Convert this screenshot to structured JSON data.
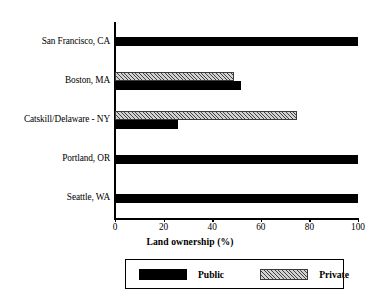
{
  "chart_data": {
    "type": "bar",
    "orientation": "horizontal",
    "title": "",
    "xlabel": "Land ownership (%)",
    "ylabel": "",
    "categories": [
      "San Francisco, CA",
      "Boston, MA",
      "Catskill/Delaware - NY",
      "Portland, OR",
      "Seattle, WA"
    ],
    "series": [
      {
        "name": "Public",
        "values": [
          100,
          52,
          26,
          100,
          100
        ],
        "color": "#000000",
        "pattern": "solid"
      },
      {
        "name": "Private",
        "values": [
          0,
          49,
          75,
          0,
          0
        ],
        "color": "#d2d2d2",
        "pattern": "diagonal-hatch"
      }
    ],
    "xlim": [
      0,
      100
    ],
    "xticks": [
      0,
      20,
      40,
      60,
      80,
      100
    ],
    "xticklabels": [
      "0",
      "20",
      "40",
      "60",
      "80",
      "100"
    ],
    "grid": false,
    "legend": {
      "position": "below-axis",
      "entries": [
        "Public",
        "Private"
      ]
    }
  }
}
